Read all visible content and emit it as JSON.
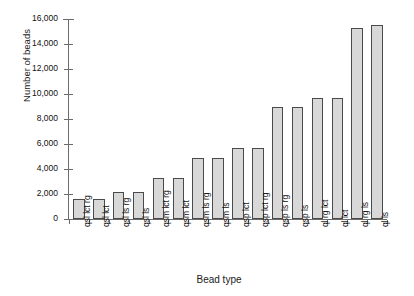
{
  "chart_data": {
    "type": "bar",
    "title": "",
    "xlabel": "Bead type",
    "ylabel": "Number of beads",
    "ylim": [
      0,
      16000
    ],
    "ytick_step": 2000,
    "yticks": [
      0,
      2000,
      4000,
      6000,
      8000,
      10000,
      12000,
      14000,
      16000
    ],
    "ytick_labels": [
      "0",
      "2,000",
      "4,000",
      "6,000",
      "8,000",
      "10,000",
      "12,000",
      "14,000",
      "16,000"
    ],
    "grid": false,
    "legend": "none",
    "categories": [
      "qsl lct rg",
      "qsl lct",
      "qsl ls rg",
      "qsl ls",
      "qsm lct rg",
      "qsm lct",
      "qsm ls rg",
      "qsm ls",
      "qsp lct",
      "qsp lct rg",
      "qsp ls rg",
      "qsp ls",
      "ql rg lct",
      "ql lct",
      "ql rg ls",
      "ql ls"
    ],
    "values": [
      1600,
      1600,
      2150,
      2150,
      3300,
      3300,
      4900,
      4900,
      5700,
      5700,
      9000,
      9000,
      9650,
      9650,
      15300,
      15500
    ],
    "bar_fill": "#d8d8d8",
    "bar_edge": "#4a4a4a",
    "axis_color": "#6b6b6b"
  },
  "axis": {
    "ylabel": "Number of beads",
    "xlabel": "Bead type"
  }
}
